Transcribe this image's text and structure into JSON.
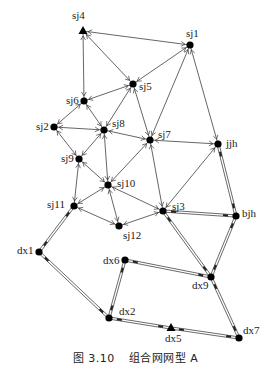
{
  "caption": {
    "figure_no": "图 3.10",
    "title": "组合网网型 A"
  },
  "colors": {
    "line": "#333333",
    "node": "#000000",
    "background": "#ffffff"
  },
  "nodes": [
    {
      "id": "sj4",
      "label": "sj4",
      "x": 83,
      "y": 31,
      "shape": "triangle",
      "lx": 72,
      "ly": 10
    },
    {
      "id": "sj1",
      "label": "sj1",
      "x": 190,
      "y": 45,
      "shape": "dot",
      "lx": 186,
      "ly": 28
    },
    {
      "id": "sj5",
      "label": "sj5",
      "x": 133,
      "y": 84,
      "shape": "dot",
      "lx": 139,
      "ly": 81
    },
    {
      "id": "sj6",
      "label": "sj6",
      "x": 84,
      "y": 101,
      "shape": "dot",
      "lx": 66,
      "ly": 95
    },
    {
      "id": "sj2",
      "label": "sj2",
      "x": 54,
      "y": 127,
      "shape": "dot",
      "lx": 36,
      "ly": 121
    },
    {
      "id": "sj8",
      "label": "sj8",
      "x": 104,
      "y": 130,
      "shape": "dot",
      "lx": 112,
      "ly": 118
    },
    {
      "id": "sj7",
      "label": "sj7",
      "x": 150,
      "y": 140,
      "shape": "dot",
      "lx": 158,
      "ly": 129
    },
    {
      "id": "jjh",
      "label": "jjh",
      "x": 218,
      "y": 144,
      "shape": "dot",
      "lx": 226,
      "ly": 138
    },
    {
      "id": "sj9",
      "label": "sj9",
      "x": 79,
      "y": 159,
      "shape": "dot",
      "lx": 61,
      "ly": 153
    },
    {
      "id": "sj10",
      "label": "sj10",
      "x": 108,
      "y": 185,
      "shape": "dot",
      "lx": 117,
      "ly": 178
    },
    {
      "id": "sj11",
      "label": "sj11",
      "x": 74,
      "y": 206,
      "shape": "dot",
      "lx": 47,
      "ly": 199
    },
    {
      "id": "sj3",
      "label": "sj3",
      "x": 163,
      "y": 211,
      "shape": "dot",
      "lx": 172,
      "ly": 201
    },
    {
      "id": "bjh",
      "label": "bjh",
      "x": 236,
      "y": 216,
      "shape": "dot",
      "lx": 242,
      "ly": 208
    },
    {
      "id": "sj12",
      "label": "sj12",
      "x": 119,
      "y": 226,
      "shape": "dot",
      "lx": 123,
      "ly": 230
    },
    {
      "id": "dx1",
      "label": "dx1",
      "x": 39,
      "y": 252,
      "shape": "dot",
      "lx": 17,
      "ly": 245
    },
    {
      "id": "dx6",
      "label": "dx6",
      "x": 125,
      "y": 260,
      "shape": "dot",
      "lx": 103,
      "ly": 255
    },
    {
      "id": "dx9",
      "label": "dx9",
      "x": 211,
      "y": 277,
      "shape": "dot",
      "lx": 192,
      "ly": 280
    },
    {
      "id": "dx2",
      "label": "dx2",
      "x": 109,
      "y": 318,
      "shape": "dot",
      "lx": 119,
      "ly": 306
    },
    {
      "id": "dx5",
      "label": "dx5",
      "x": 171,
      "y": 328,
      "shape": "triangle",
      "lx": 165,
      "ly": 333
    },
    {
      "id": "dx7",
      "label": "dx7",
      "x": 239,
      "y": 338,
      "shape": "dot",
      "lx": 243,
      "ly": 325
    }
  ],
  "edges": [
    {
      "a": "sj4",
      "b": "sj1",
      "type": "single"
    },
    {
      "a": "sj4",
      "b": "sj5",
      "type": "single"
    },
    {
      "a": "sj4",
      "b": "sj6",
      "type": "single"
    },
    {
      "a": "sj1",
      "b": "sj5",
      "type": "single"
    },
    {
      "a": "sj1",
      "b": "sj7",
      "type": "single"
    },
    {
      "a": "sj1",
      "b": "jjh",
      "type": "single"
    },
    {
      "a": "sj5",
      "b": "sj6",
      "type": "single"
    },
    {
      "a": "sj5",
      "b": "sj8",
      "type": "single"
    },
    {
      "a": "sj5",
      "b": "sj7",
      "type": "single"
    },
    {
      "a": "sj6",
      "b": "sj2",
      "type": "single"
    },
    {
      "a": "sj6",
      "b": "sj8",
      "type": "single"
    },
    {
      "a": "sj2",
      "b": "sj8",
      "type": "single"
    },
    {
      "a": "sj2",
      "b": "sj9",
      "type": "single"
    },
    {
      "a": "sj8",
      "b": "sj9",
      "type": "single"
    },
    {
      "a": "sj8",
      "b": "sj7",
      "type": "single"
    },
    {
      "a": "sj8",
      "b": "sj10",
      "type": "single"
    },
    {
      "a": "sj7",
      "b": "jjh",
      "type": "single"
    },
    {
      "a": "sj7",
      "b": "sj10",
      "type": "single"
    },
    {
      "a": "sj7",
      "b": "sj3",
      "type": "single"
    },
    {
      "a": "sj9",
      "b": "sj10",
      "type": "single"
    },
    {
      "a": "sj9",
      "b": "sj11",
      "type": "single"
    },
    {
      "a": "sj10",
      "b": "sj11",
      "type": "single"
    },
    {
      "a": "sj10",
      "b": "sj3",
      "type": "single"
    },
    {
      "a": "sj10",
      "b": "sj12",
      "type": "single"
    },
    {
      "a": "sj11",
      "b": "sj12",
      "type": "single"
    },
    {
      "a": "sj12",
      "b": "sj3",
      "type": "single"
    },
    {
      "a": "jjh",
      "b": "sj3",
      "type": "single"
    },
    {
      "a": "jjh",
      "b": "bjh",
      "type": "double"
    },
    {
      "a": "bjh",
      "b": "sj3",
      "type": "double"
    },
    {
      "a": "bjh",
      "b": "dx9",
      "type": "double"
    },
    {
      "a": "sj3",
      "b": "dx9",
      "type": "double"
    },
    {
      "a": "sj11",
      "b": "dx1",
      "type": "double"
    },
    {
      "a": "dx1",
      "b": "dx2",
      "type": "double"
    },
    {
      "a": "dx6",
      "b": "dx2",
      "type": "double"
    },
    {
      "a": "dx6",
      "b": "dx9",
      "type": "double"
    },
    {
      "a": "dx9",
      "b": "dx7",
      "type": "double"
    },
    {
      "a": "dx2",
      "b": "dx5",
      "type": "double"
    },
    {
      "a": "dx5",
      "b": "dx7",
      "type": "double"
    }
  ]
}
